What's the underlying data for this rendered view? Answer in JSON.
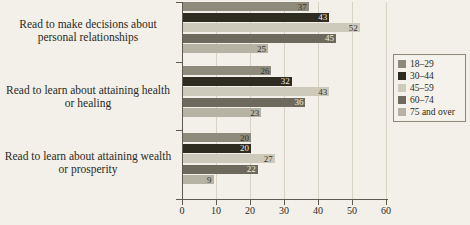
{
  "chart_data": {
    "type": "bar",
    "orientation": "horizontal",
    "title": "",
    "xlabel": "",
    "ylabel": "",
    "xlim": [
      0,
      60
    ],
    "xticks": [
      0,
      10,
      20,
      30,
      40,
      50,
      60
    ],
    "grid": true,
    "legend_position": "right",
    "categories": [
      "Read to make decisions about personal relationships",
      "Read to learn about attaining health or healing",
      "Read to learn about attaining wealth or prosperity"
    ],
    "series": [
      {
        "name": "18–29",
        "color": "#8e8a7c",
        "values": [
          37,
          26,
          20
        ]
      },
      {
        "name": "30–44",
        "color": "#2e2b20",
        "values": [
          43,
          32,
          20
        ]
      },
      {
        "name": "45–59",
        "color": "#cdc9bb",
        "values": [
          52,
          43,
          27
        ]
      },
      {
        "name": "60–74",
        "color": "#6d6a5d",
        "values": [
          45,
          36,
          22
        ]
      },
      {
        "name": "75 and over",
        "color": "#b6b2a4",
        "values": [
          25,
          23,
          9
        ]
      }
    ]
  },
  "axis": {
    "tick_labels": [
      "0",
      "10",
      "20",
      "30",
      "40",
      "50",
      "60"
    ]
  },
  "footer": {
    "note": ""
  }
}
